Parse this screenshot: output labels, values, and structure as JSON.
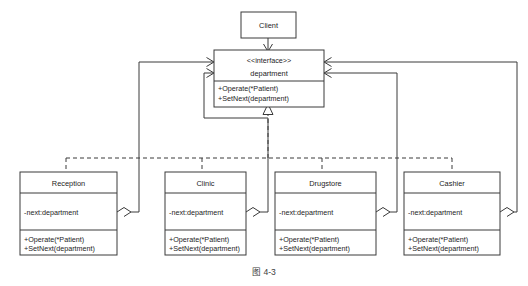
{
  "figure": {
    "caption": "图 4-3",
    "background_color": "#ffffff",
    "line_color": "#3a3a3a",
    "text_color": "#1c1c1c"
  },
  "client": {
    "name": "Client"
  },
  "interface": {
    "stereotype": "<<interface>>",
    "name": "department",
    "operations": [
      "+Operate(*Patient)",
      "+SetNext(department)"
    ]
  },
  "classes": [
    {
      "name": "Reception",
      "attributes": [
        "-next:department"
      ],
      "operations": [
        "+Operate(*Patient)",
        "+SetNext(department)"
      ]
    },
    {
      "name": "Clinic",
      "attributes": [
        "-next:department"
      ],
      "operations": [
        "+Operate(*Patient)",
        "+SetNext(department)"
      ]
    },
    {
      "name": "Drugstore",
      "attributes": [
        "-next:department"
      ],
      "operations": [
        "+Operate(*Patient)",
        "+SetNext(department)"
      ]
    },
    {
      "name": "Cashier",
      "attributes": [
        "-next:department"
      ],
      "operations": [
        "+Operate(*Patient)",
        "+SetNext(department)"
      ]
    }
  ],
  "relations": {
    "client_to_interface": "dependency-arrow",
    "realization": "dashed-hollow-triangle",
    "aggregation": "hollow-diamond"
  }
}
